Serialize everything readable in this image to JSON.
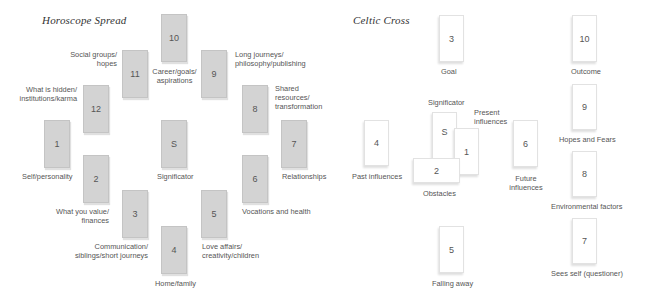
{
  "horoscope": {
    "title": "Horoscope Spread",
    "cards": {
      "c1": "1",
      "c2": "2",
      "c3": "3",
      "c4": "4",
      "c5": "5",
      "c6": "6",
      "c7": "7",
      "c8": "8",
      "c9": "9",
      "c10": "10",
      "c11": "11",
      "c12": "12",
      "s": "S"
    },
    "labels": {
      "c1": "Self/personality",
      "c2a": "What you value/",
      "c2b": "finances",
      "c3a": "Communication/",
      "c3b": "siblings/short journeys",
      "c4": "Home/family",
      "c5a": "Love affairs/",
      "c5b": "creativity/children",
      "c6": "Vocations and health",
      "c7": "Relationships",
      "c8a": "Shared",
      "c8b": "resources/",
      "c8c": "transformation",
      "c9a": "Long journeys/",
      "c9b": "philosophy/publishing",
      "c10a": "Career/goals/",
      "c10b": "aspirations",
      "c11a": "Social groups/",
      "c11b": "hopes",
      "c12a": "What is hidden/",
      "c12b": "institutions/karma",
      "s": "Significator"
    },
    "card_color": "#d3d3d3"
  },
  "celtic": {
    "title": "Celtic Cross",
    "cards": {
      "c1": "1",
      "c2": "2",
      "c3": "3",
      "c4": "4",
      "c5": "5",
      "c6": "6",
      "c7": "7",
      "c8": "8",
      "c9": "9",
      "c10": "10",
      "s": "S"
    },
    "labels": {
      "c3": "Goal",
      "s": "Significator",
      "c1a": "Present",
      "c1b": "influences",
      "c4": "Past influences",
      "c2": "Obstacles",
      "c6a": "Future",
      "c6b": "influences",
      "c5": "Falling away",
      "c10": "Outcome",
      "c9": "Hopes and Fears",
      "c8": "Environmental factors",
      "c7": "Sees self (questioner)"
    },
    "card_color": "#ffffff"
  }
}
